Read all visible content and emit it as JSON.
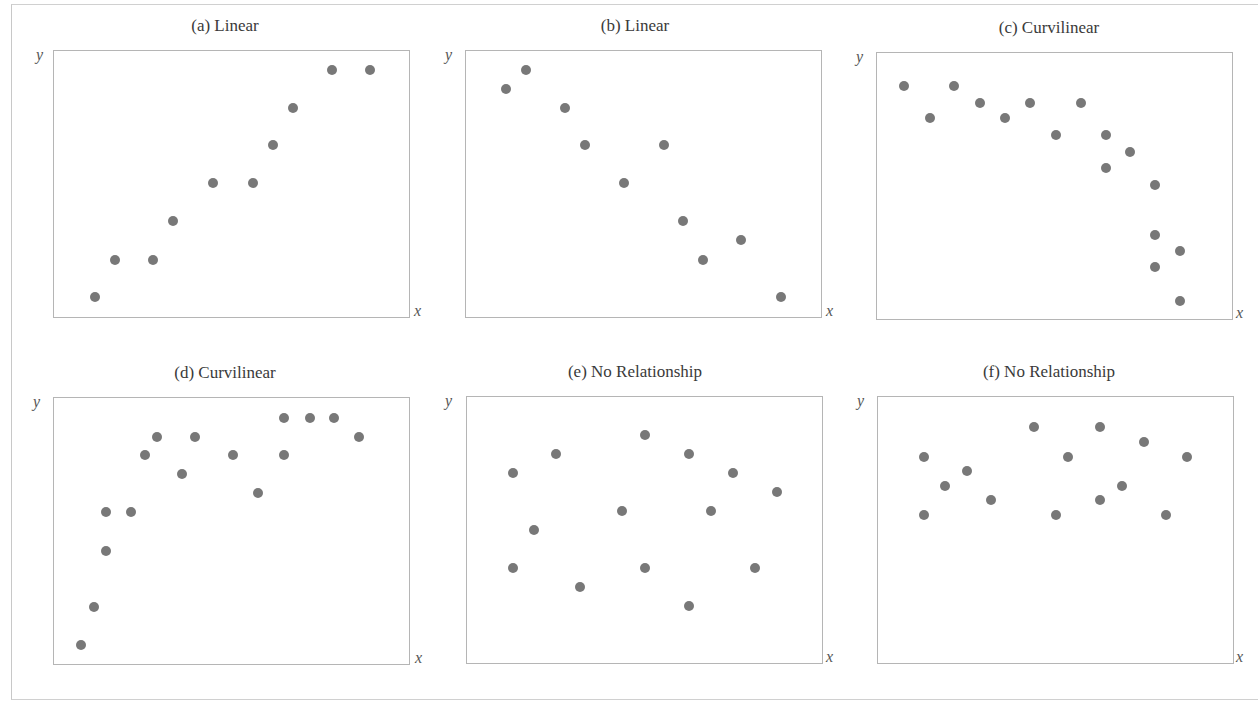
{
  "figure": {
    "dot_color": "#787878",
    "frame_color": "#b5b5b5",
    "axis_labels": {
      "x": "x",
      "y": "y"
    }
  },
  "chart_data": [
    {
      "type": "scatter",
      "title": "(a) Linear",
      "xlabel": "x",
      "ylabel": "y",
      "xlim": [
        0,
        100
      ],
      "ylim": [
        0,
        100
      ],
      "grid": false,
      "ticks": false,
      "points": [
        [
          11.5,
          7.5
        ],
        [
          17.1,
          21.6
        ],
        [
          28.0,
          21.6
        ],
        [
          33.6,
          36.2
        ],
        [
          44.8,
          50.4
        ],
        [
          56.0,
          50.4
        ],
        [
          61.6,
          64.6
        ],
        [
          67.2,
          78.7
        ],
        [
          78.2,
          92.9
        ],
        [
          89.1,
          92.9
        ]
      ]
    },
    {
      "type": "scatter",
      "title": "(b) Linear",
      "xlabel": "x",
      "ylabel": "y",
      "xlim": [
        0,
        100
      ],
      "ylim": [
        0,
        100
      ],
      "grid": false,
      "ticks": false,
      "points": [
        [
          11.2,
          85.8
        ],
        [
          16.8,
          92.9
        ],
        [
          28.0,
          78.7
        ],
        [
          33.6,
          64.6
        ],
        [
          44.5,
          50.4
        ],
        [
          55.7,
          64.6
        ],
        [
          61.1,
          36.2
        ],
        [
          66.7,
          21.6
        ],
        [
          77.6,
          29.1
        ],
        [
          88.8,
          7.5
        ]
      ]
    },
    {
      "type": "scatter",
      "title": "(c) Curvilinear",
      "xlabel": "x",
      "ylabel": "y",
      "xlim": [
        0,
        100
      ],
      "ylim": [
        0,
        100
      ],
      "grid": false,
      "ticks": false,
      "points": [
        [
          7.6,
          87.7
        ],
        [
          14.8,
          75.4
        ],
        [
          21.8,
          87.7
        ],
        [
          29.1,
          81.3
        ],
        [
          36.1,
          75.4
        ],
        [
          43.1,
          81.3
        ],
        [
          50.4,
          69.0
        ],
        [
          57.4,
          81.3
        ],
        [
          64.4,
          69.0
        ],
        [
          64.4,
          56.7
        ],
        [
          71.4,
          62.7
        ],
        [
          78.4,
          50.4
        ],
        [
          78.4,
          31.7
        ],
        [
          85.4,
          25.4
        ],
        [
          78.4,
          19.4
        ],
        [
          85.4,
          6.7
        ]
      ]
    },
    {
      "type": "scatter",
      "title": "(d) Curvilinear",
      "xlabel": "x",
      "ylabel": "y",
      "xlim": [
        0,
        100
      ],
      "ylim": [
        0,
        100
      ],
      "grid": false,
      "ticks": false,
      "points": [
        [
          7.6,
          7.1
        ],
        [
          11.2,
          21.3
        ],
        [
          14.6,
          42.5
        ],
        [
          14.6,
          57.1
        ],
        [
          21.8,
          57.1
        ],
        [
          25.5,
          78.4
        ],
        [
          29.1,
          85.4
        ],
        [
          36.1,
          71.3
        ],
        [
          39.8,
          85.4
        ],
        [
          50.4,
          78.4
        ],
        [
          57.4,
          64.2
        ],
        [
          64.7,
          78.4
        ],
        [
          64.7,
          92.5
        ],
        [
          72.0,
          92.5
        ],
        [
          79.0,
          92.5
        ],
        [
          86.0,
          85.4
        ]
      ]
    },
    {
      "type": "scatter",
      "title": "(e) No Relationship",
      "xlabel": "x",
      "ylabel": "y",
      "xlim": [
        0,
        100
      ],
      "ylim": [
        0,
        100
      ],
      "grid": false,
      "ticks": false,
      "points": [
        [
          12.9,
          71.3
        ],
        [
          19.0,
          50.0
        ],
        [
          12.9,
          35.8
        ],
        [
          25.2,
          78.4
        ],
        [
          31.7,
          28.7
        ],
        [
          43.7,
          57.1
        ],
        [
          50.1,
          85.8
        ],
        [
          50.1,
          35.8
        ],
        [
          62.5,
          78.4
        ],
        [
          68.6,
          57.1
        ],
        [
          62.5,
          21.6
        ],
        [
          74.8,
          71.3
        ],
        [
          81.0,
          35.8
        ],
        [
          87.4,
          64.2
        ]
      ]
    },
    {
      "type": "scatter",
      "title": "(f) No Relationship",
      "xlabel": "x",
      "ylabel": "y",
      "xlim": [
        0,
        100
      ],
      "ylim": [
        0,
        100
      ],
      "grid": false,
      "ticks": false,
      "points": [
        [
          12.9,
          77.6
        ],
        [
          12.9,
          55.6
        ],
        [
          19.0,
          66.4
        ],
        [
          25.2,
          72.0
        ],
        [
          31.7,
          61.2
        ],
        [
          44.0,
          88.8
        ],
        [
          50.1,
          55.6
        ],
        [
          53.5,
          77.6
        ],
        [
          62.5,
          88.8
        ],
        [
          62.5,
          61.2
        ],
        [
          68.6,
          66.4
        ],
        [
          74.8,
          83.2
        ],
        [
          81.0,
          55.6
        ],
        [
          87.1,
          77.6
        ]
      ]
    }
  ]
}
